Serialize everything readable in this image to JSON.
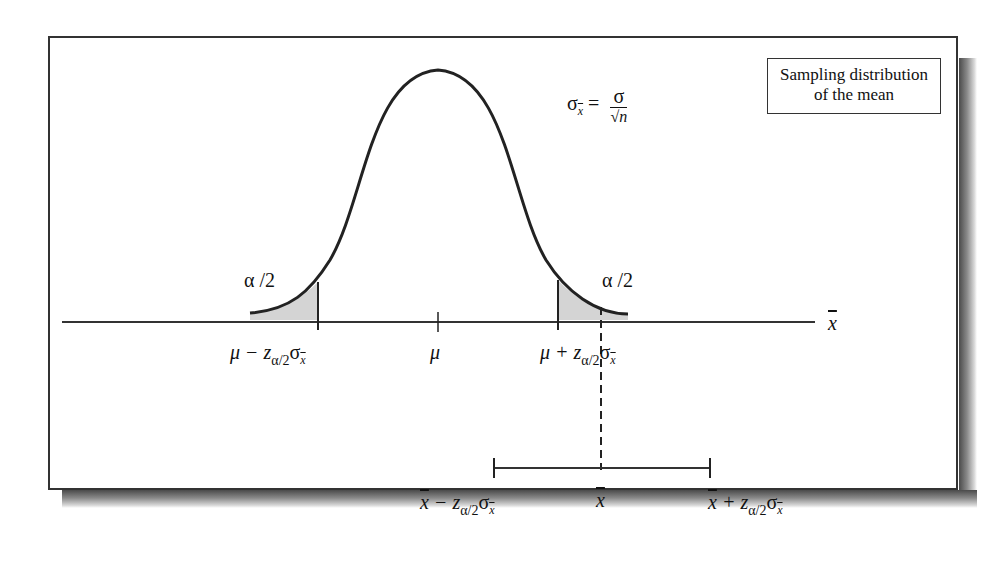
{
  "diagram": {
    "title_box": {
      "line1": "Sampling distribution",
      "line2": "of the mean"
    },
    "formula": {
      "lhs_symbol": "σ",
      "lhs_subscript": "x",
      "equals": "=",
      "numerator": "σ",
      "denominator": "√n"
    },
    "tail_labels": {
      "left": "α /2",
      "right": "α /2"
    },
    "axis": {
      "label": "x",
      "tick_labels": {
        "left": {
          "main": "μ − z",
          "sub": "α/2",
          "sigma": "σ",
          "sigma_sub": "x"
        },
        "center": "μ",
        "right": {
          "main": "μ + z",
          "sub": "α/2",
          "sigma": "σ",
          "sigma_sub": "x"
        }
      }
    },
    "interval": {
      "left": {
        "xbar": "x",
        "minus": " − z",
        "sub": "α/2",
        "sigma": "σ",
        "sigma_sub": "x"
      },
      "center": "x",
      "right": {
        "xbar": "x",
        "plus": " + z",
        "sub": "α/2",
        "sigma": "σ",
        "sigma_sub": "x"
      }
    },
    "colors": {
      "line": "#222222",
      "tail_fill": "#d4d4d4",
      "frame": "#333333"
    }
  }
}
